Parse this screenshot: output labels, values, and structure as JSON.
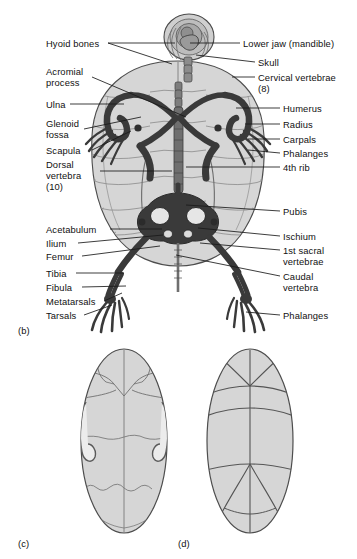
{
  "figure": {
    "view": "dorsal / ventral"
  },
  "colors": {
    "shell_fill": "#d6d6d6",
    "shell_fill_light": "#e2e2e2",
    "shell_outline": "#555555",
    "suture_line": "#8a8a8a",
    "bone_dark": "#3a3a3a",
    "bone_mid": "#555555",
    "leader_line": "#1a1a1a",
    "text": "#111111",
    "background": "#ffffff"
  },
  "panels": [
    {
      "tag": "(b)",
      "name": "skeleton-dorsal-view",
      "x": 18,
      "y": 325
    },
    {
      "tag": "(c)",
      "name": "plastron-view",
      "x": 18,
      "y": 538
    },
    {
      "tag": "(d)",
      "name": "carapace-view",
      "x": 178,
      "y": 538
    }
  ],
  "labels_left": [
    {
      "id": "hyoid-bones",
      "text": "Hyoid bones",
      "x": 46,
      "y": 38,
      "lines": 1
    },
    {
      "id": "acromial-process",
      "text": "Acromial\nprocess",
      "x": 46,
      "y": 66,
      "lines": 2
    },
    {
      "id": "ulna",
      "text": "Ulna",
      "x": 46,
      "y": 99,
      "lines": 1
    },
    {
      "id": "glenoid-fossa",
      "text": "Glenoid\nfossa",
      "x": 46,
      "y": 118,
      "lines": 2
    },
    {
      "id": "scapula",
      "text": "Scapula",
      "x": 46,
      "y": 145,
      "lines": 1
    },
    {
      "id": "dorsal-vertebra",
      "text": "Dorsal\nvertebra\n(10)",
      "x": 46,
      "y": 159,
      "lines": 3
    },
    {
      "id": "acetabulum",
      "text": "Acetabulum",
      "x": 46,
      "y": 224,
      "lines": 1
    },
    {
      "id": "ilium",
      "text": "Ilium",
      "x": 46,
      "y": 238,
      "lines": 1
    },
    {
      "id": "femur",
      "text": "Femur",
      "x": 46,
      "y": 251,
      "lines": 1
    },
    {
      "id": "tibia",
      "text": "Tibia",
      "x": 46,
      "y": 268,
      "lines": 1
    },
    {
      "id": "fibula",
      "text": "Fibula",
      "x": 46,
      "y": 282,
      "lines": 1
    },
    {
      "id": "metatarsals",
      "text": "Metatarsals",
      "x": 46,
      "y": 296,
      "lines": 1
    },
    {
      "id": "tarsals",
      "text": "Tarsals",
      "x": 46,
      "y": 310,
      "lines": 1
    }
  ],
  "labels_right": [
    {
      "id": "lower-jaw-mandible",
      "text": "Lower jaw (mandible)",
      "x": 243,
      "y": 38,
      "lines": 1
    },
    {
      "id": "skull",
      "text": "Skull",
      "x": 258,
      "y": 57,
      "lines": 1
    },
    {
      "id": "cervical-vertebrae",
      "text": "Cervical vertebrae\n(8)",
      "x": 258,
      "y": 72,
      "lines": 2
    },
    {
      "id": "humerus",
      "text": "Humerus",
      "x": 283,
      "y": 103,
      "lines": 1
    },
    {
      "id": "radius",
      "text": "Radius",
      "x": 283,
      "y": 119,
      "lines": 1
    },
    {
      "id": "carpals",
      "text": "Carpals",
      "x": 283,
      "y": 134,
      "lines": 1
    },
    {
      "id": "phalanges-fore",
      "text": "Phalanges",
      "x": 283,
      "y": 148,
      "lines": 1
    },
    {
      "id": "fourth-rib",
      "text": "4th rib",
      "x": 283,
      "y": 162,
      "lines": 1
    },
    {
      "id": "pubis",
      "text": "Pubis",
      "x": 283,
      "y": 206,
      "lines": 1
    },
    {
      "id": "ischium",
      "text": "Ischium",
      "x": 283,
      "y": 231,
      "lines": 1
    },
    {
      "id": "first-sacral-vertebrae",
      "text": "1st sacral\nvertebrae",
      "x": 283,
      "y": 245,
      "lines": 2
    },
    {
      "id": "caudal-vertebra",
      "text": "Caudal\nvertebra",
      "x": 283,
      "y": 271,
      "lines": 2
    },
    {
      "id": "phalanges-hind",
      "text": "Phalanges",
      "x": 283,
      "y": 310,
      "lines": 1
    }
  ],
  "leader_lines_left": [
    {
      "id": "hyoid-bones",
      "x1": 108,
      "y1": 43,
      "x2": 175,
      "y2": 43
    },
    {
      "id": "hyoid-bones-b",
      "x1": 108,
      "y1": 43,
      "x2": 172,
      "y2": 64
    },
    {
      "id": "acromial-process",
      "x1": 92,
      "y1": 77,
      "x2": 186,
      "y2": 117
    },
    {
      "id": "ulna",
      "x1": 70,
      "y1": 104,
      "x2": 124,
      "y2": 104
    },
    {
      "id": "glenoid-fossa",
      "x1": 84,
      "y1": 129,
      "x2": 141,
      "y2": 117
    },
    {
      "id": "scapula",
      "x1": 92,
      "y1": 150,
      "x2": 131,
      "y2": 131
    },
    {
      "id": "dorsal-vertebra",
      "x1": 100,
      "y1": 171,
      "x2": 172,
      "y2": 171
    },
    {
      "id": "acetabulum",
      "x1": 110,
      "y1": 229,
      "x2": 162,
      "y2": 229
    },
    {
      "id": "ilium",
      "x1": 78,
      "y1": 243,
      "x2": 163,
      "y2": 235
    },
    {
      "id": "femur",
      "x1": 82,
      "y1": 256,
      "x2": 160,
      "y2": 246
    },
    {
      "id": "tibia",
      "x1": 76,
      "y1": 273,
      "x2": 124,
      "y2": 273
    },
    {
      "id": "fibula",
      "x1": 82,
      "y1": 287,
      "x2": 126,
      "y2": 286
    },
    {
      "id": "metatarsals",
      "x1": 104,
      "y1": 301,
      "x2": 122,
      "y2": 293
    },
    {
      "id": "tarsals",
      "x1": 84,
      "y1": 315,
      "x2": 112,
      "y2": 305
    }
  ],
  "leader_lines_right": [
    {
      "id": "lower-jaw-mandible",
      "x1": 240,
      "y1": 43,
      "x2": 190,
      "y2": 43
    },
    {
      "id": "skull",
      "x1": 255,
      "y1": 62,
      "x2": 196,
      "y2": 55
    },
    {
      "id": "cervical-vertebrae",
      "x1": 255,
      "y1": 77,
      "x2": 232,
      "y2": 77
    },
    {
      "id": "humerus",
      "x1": 280,
      "y1": 108,
      "x2": 236,
      "y2": 108
    },
    {
      "id": "radius",
      "x1": 280,
      "y1": 124,
      "x2": 245,
      "y2": 124
    },
    {
      "id": "carpals",
      "x1": 280,
      "y1": 139,
      "x2": 248,
      "y2": 139
    },
    {
      "id": "phalanges-fore",
      "x1": 280,
      "y1": 153,
      "x2": 248,
      "y2": 150
    },
    {
      "id": "fourth-rib",
      "x1": 280,
      "y1": 167,
      "x2": 186,
      "y2": 167
    },
    {
      "id": "pubis",
      "x1": 280,
      "y1": 211,
      "x2": 186,
      "y2": 205
    },
    {
      "id": "ischium",
      "x1": 280,
      "y1": 236,
      "x2": 198,
      "y2": 228
    },
    {
      "id": "first-sacral",
      "x1": 280,
      "y1": 250,
      "x2": 200,
      "y2": 243
    },
    {
      "id": "caudal-vertebra",
      "x1": 280,
      "y1": 276,
      "x2": 176,
      "y2": 255
    },
    {
      "id": "phalanges-hind",
      "x1": 280,
      "y1": 315,
      "x2": 246,
      "y2": 312
    }
  ]
}
